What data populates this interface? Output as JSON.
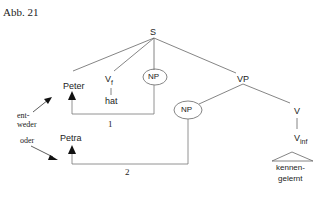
{
  "figure": {
    "caption": "Abb. 21"
  },
  "tree": {
    "root": "S",
    "nodes": {
      "subject": "Peter",
      "vf": "V",
      "vf_sub": "f",
      "vf_word": "hat",
      "np_object": "NP",
      "vp": "VP",
      "np_inner": "NP",
      "v": "V",
      "vinf": "V",
      "vinf_sub": "inf",
      "vinf_word_1": "kennen-",
      "vinf_word_2": "gelernt",
      "alt_subject": "Petra"
    },
    "movement_labels": {
      "path_1": "1",
      "path_2": "2"
    },
    "annotations": {
      "either_1": "ent-",
      "either_2": "weder",
      "or": "oder"
    }
  },
  "colors": {
    "line": "#666666",
    "text": "#222222",
    "arrow": "#111111"
  }
}
